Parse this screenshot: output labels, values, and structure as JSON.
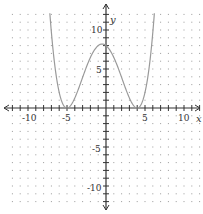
{
  "chart_data": {
    "type": "line",
    "title": "",
    "xlabel": "x",
    "ylabel": "y",
    "xlim": [
      -12,
      12
    ],
    "ylim": [
      -12,
      12
    ],
    "grid": true,
    "grid_style": "dotted",
    "x_ticks": [
      -10,
      -5,
      5,
      10
    ],
    "y_ticks": [
      10,
      5,
      -5,
      -10
    ],
    "x_tick_labels": [
      "-10",
      "-5",
      "5",
      "10"
    ],
    "y_tick_labels": [
      "10",
      "5",
      "-5",
      "-10"
    ],
    "series": [
      {
        "name": "f(x)",
        "description": "quartic touching x-axis at x=-5 and x=4, local max ~8 at x=0",
        "x": [
          -7.3,
          -7,
          -6,
          -5,
          -4,
          -3,
          -2,
          -1,
          0,
          1,
          2,
          3,
          4,
          5,
          6,
          6.3
        ],
        "y": [
          12.8,
          9.68,
          2.0,
          0,
          1.28,
          3.92,
          6.48,
          8.0,
          8.0,
          7.2,
          4.9,
          1.28,
          0,
          1.62,
          9.68,
          12.8
        ]
      }
    ],
    "colors": {
      "curve": "#9a9a9a",
      "axes": "#333333",
      "grid": "#9a9a9a"
    }
  },
  "axes": {
    "x_label": "x",
    "y_label": "y"
  },
  "labels": {
    "x_neg10": "-10",
    "x_neg5": "-5",
    "x_5": "5",
    "x_10": "10",
    "y_10": "10",
    "y_5": "5",
    "y_neg5": "-5",
    "y_neg10": "-10"
  }
}
